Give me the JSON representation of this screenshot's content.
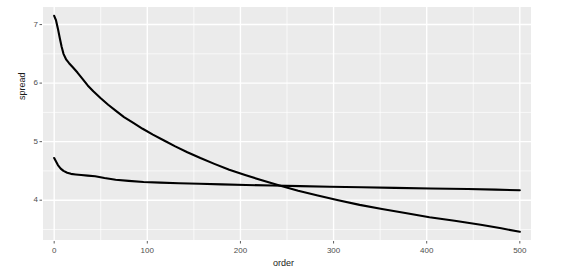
{
  "chart_data": {
    "type": "line",
    "title": "",
    "xlabel": "order",
    "ylabel": "spread",
    "xlim": [
      -12,
      512
    ],
    "ylim": [
      3.32,
      7.3
    ],
    "grid": true,
    "grid_major_x": [
      0,
      100,
      200,
      300,
      400,
      500
    ],
    "grid_major_y": [
      4,
      5,
      6,
      7
    ],
    "grid_minor_x": [
      50,
      150,
      250,
      350,
      450
    ],
    "grid_minor_y": [
      3.5,
      4.5,
      5.5,
      6.5
    ],
    "legend": "none",
    "panel_background": "#ebebeb",
    "grid_color": "#ffffff",
    "line_color": "#000000",
    "line_width": 2.1,
    "xticks": [
      0,
      100,
      200,
      300,
      400,
      500
    ],
    "xtick_labels": [
      "0",
      "100",
      "200",
      "300",
      "400",
      "500"
    ],
    "yticks": [
      4,
      5,
      6,
      7
    ],
    "ytick_labels": [
      "4",
      "5",
      "6",
      "7"
    ],
    "series": [
      {
        "name": "descending",
        "x": [
          0,
          2,
          4,
          6,
          8,
          10,
          13,
          16,
          20,
          25,
          30,
          36,
          42,
          50,
          58,
          66,
          75,
          85,
          95,
          106,
          118,
          130,
          143,
          157,
          172,
          188,
          205,
          223,
          242,
          262,
          283,
          305,
          328,
          352,
          377,
          403,
          430,
          458,
          480,
          500
        ],
        "y": [
          7.15,
          7.07,
          6.93,
          6.77,
          6.62,
          6.5,
          6.4,
          6.34,
          6.27,
          6.18,
          6.08,
          5.96,
          5.86,
          5.74,
          5.63,
          5.53,
          5.42,
          5.32,
          5.22,
          5.12,
          5.02,
          4.92,
          4.82,
          4.72,
          4.62,
          4.52,
          4.43,
          4.34,
          4.25,
          4.16,
          4.08,
          4.0,
          3.92,
          3.85,
          3.78,
          3.71,
          3.65,
          3.58,
          3.52,
          3.46
        ]
      },
      {
        "name": "flat",
        "x": [
          0,
          2,
          4,
          7,
          10,
          14,
          18,
          23,
          29,
          36,
          44,
          54,
          66,
          80,
          96,
          114,
          134,
          156,
          180,
          206,
          234,
          264,
          296,
          330,
          366,
          404,
          444,
          474,
          500
        ],
        "y": [
          4.72,
          4.66,
          4.6,
          4.54,
          4.5,
          4.47,
          4.45,
          4.44,
          4.43,
          4.42,
          4.41,
          4.38,
          4.35,
          4.33,
          4.31,
          4.3,
          4.29,
          4.28,
          4.27,
          4.26,
          4.25,
          4.24,
          4.23,
          4.22,
          4.21,
          4.2,
          4.19,
          4.18,
          4.17
        ]
      }
    ]
  },
  "axes": {
    "y_title": "spread",
    "x_title": "order"
  }
}
